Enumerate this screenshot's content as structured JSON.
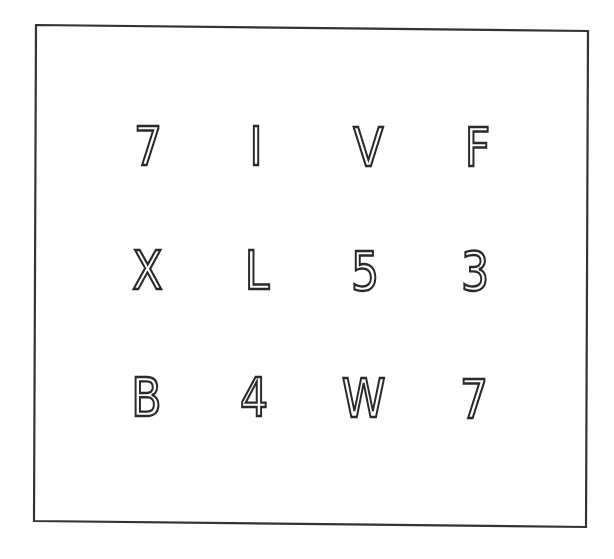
{
  "stimulus": {
    "frame": {
      "stroke_color": "#333333",
      "background": "#ffffff",
      "corners": {
        "top_left": [
          36,
          25
        ],
        "top_right": [
          588,
          31
        ],
        "bottom_right": [
          586,
          527
        ],
        "bottom_left": [
          34,
          521
        ]
      }
    },
    "grid": {
      "rows": 3,
      "columns": 4,
      "cells": [
        [
          "7",
          "I",
          "V",
          "F"
        ],
        [
          "X",
          "L",
          "5",
          "3"
        ],
        [
          "B",
          "4",
          "W",
          "7"
        ]
      ]
    },
    "row_0": {
      "c0": "7",
      "c1": "I",
      "c2": "V",
      "c3": "F"
    },
    "row_1": {
      "c0": "X",
      "c1": "L",
      "c2": "5",
      "c3": "3"
    },
    "row_2": {
      "c0": "B",
      "c1": "4",
      "c2": "W",
      "c3": "7"
    },
    "text_color": "#2a2a2a"
  }
}
